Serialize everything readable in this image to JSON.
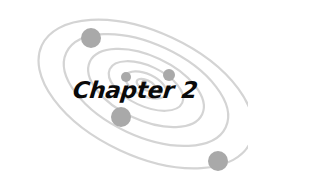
{
  "title": "Chapter 2",
  "colors": {
    "orbit": "#d4d4d4",
    "planet": "#a9a9a9",
    "text": "#0a0a0a",
    "background": "#ffffff"
  },
  "orbits": [
    {
      "cx": 146,
      "cy": 94,
      "rx": 115,
      "ry": 62,
      "rotate": 25
    },
    {
      "cx": 146,
      "cy": 90,
      "rx": 88,
      "ry": 46,
      "rotate": 25
    },
    {
      "cx": 146,
      "cy": 88,
      "rx": 62,
      "ry": 32,
      "rotate": 25
    },
    {
      "cx": 146,
      "cy": 86,
      "rx": 40,
      "ry": 20,
      "rotate": 25
    },
    {
      "cx": 146,
      "cy": 85,
      "rx": 22,
      "ry": 11,
      "rotate": 25
    },
    {
      "cx": 146,
      "cy": 85,
      "rx": 10,
      "ry": 5,
      "rotate": 25
    }
  ],
  "planets": [
    {
      "cx": 91,
      "cy": 38,
      "r": 10
    },
    {
      "cx": 121,
      "cy": 117,
      "r": 10
    },
    {
      "cx": 218,
      "cy": 161,
      "r": 10
    },
    {
      "cx": 126,
      "cy": 77,
      "r": 5
    },
    {
      "cx": 169,
      "cy": 75,
      "r": 6
    },
    {
      "cx": 144,
      "cy": 83,
      "r": 3
    },
    {
      "cx": 160,
      "cy": 91,
      "r": 3
    }
  ]
}
